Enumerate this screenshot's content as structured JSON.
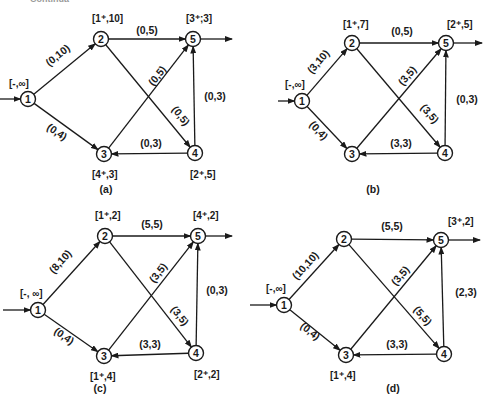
{
  "top_fragment": "Continua",
  "arrow_color": "#1a1a1a",
  "panels": [
    {
      "id": "a",
      "caption": "(a)",
      "caption_pos": [
        106,
        193
      ],
      "nodes": [
        {
          "id": 1,
          "x": 28,
          "y": 99,
          "label": "[-,∞]",
          "label_pos": [
            9,
            87
          ]
        },
        {
          "id": 2,
          "x": 101,
          "y": 39,
          "label": "[1⁺,10]",
          "label_pos": [
            92,
            22
          ]
        },
        {
          "id": 3,
          "x": 104,
          "y": 154,
          "label": "[4⁺,3]",
          "label_pos": [
            92,
            178
          ]
        },
        {
          "id": 4,
          "x": 195,
          "y": 153,
          "label": "[2⁺,5]",
          "label_pos": [
            190,
            178
          ]
        },
        {
          "id": 5,
          "x": 193,
          "y": 39,
          "label": "[3⁺;3]",
          "label_pos": [
            186,
            22
          ]
        }
      ],
      "source_arrow": {
        "from": [
          0,
          99
        ],
        "to": 1
      },
      "sink_arrow": {
        "from": 5,
        "to": [
          232,
          39
        ]
      },
      "edges": [
        {
          "from": 1,
          "to": 2,
          "label": "(0,10)",
          "label_pos": [
            60,
            58
          ],
          "angle": -39
        },
        {
          "from": 1,
          "to": 3,
          "label": "(0,4)",
          "label_pos": [
            55,
            135
          ],
          "angle": 34
        },
        {
          "from": 2,
          "to": 5,
          "label": "(0,5)",
          "label_pos": [
            147,
            34
          ],
          "angle": 0
        },
        {
          "from": 2,
          "to": 4,
          "label": "(0,5)",
          "label_pos": [
            178,
            118
          ],
          "angle": 52
        },
        {
          "from": 3,
          "to": 5,
          "label": "(0,5)",
          "label_pos": [
            160,
            78
          ],
          "angle": -51
        },
        {
          "from": 4,
          "to": 3,
          "label": "(0,3)",
          "label_pos": [
            151,
            147
          ],
          "angle": 0
        },
        {
          "from": 4,
          "to": 5,
          "label": "(0,3)",
          "label_pos": [
            215,
            100
          ],
          "angle": 0
        }
      ]
    },
    {
      "id": "b",
      "caption": "(b)",
      "caption_pos": [
        373,
        193
      ],
      "nodes": [
        {
          "id": 1,
          "x": 302,
          "y": 101,
          "label": "[-,∞]",
          "label_pos": [
            285,
            88
          ]
        },
        {
          "id": 2,
          "x": 352,
          "y": 43,
          "label": "[1⁺,7]",
          "label_pos": [
            343,
            28
          ]
        },
        {
          "id": 3,
          "x": 352,
          "y": 154,
          "label": "",
          "label_pos": [
            0,
            0
          ]
        },
        {
          "id": 4,
          "x": 445,
          "y": 153,
          "label": "",
          "label_pos": [
            0,
            0
          ]
        },
        {
          "id": 5,
          "x": 446,
          "y": 43,
          "label": "[2⁺,5]",
          "label_pos": [
            447,
            28
          ]
        }
      ],
      "source_arrow": {
        "from": [
          278,
          101
        ],
        "to": 1
      },
      "sink_arrow": {
        "from": 5,
        "to": [
          482,
          43
        ]
      },
      "edges": [
        {
          "from": 1,
          "to": 2,
          "label": "(3,10)",
          "label_pos": [
            321,
            64
          ],
          "angle": -49
        },
        {
          "from": 1,
          "to": 3,
          "label": "(0,4)",
          "label_pos": [
            316,
            133
          ],
          "angle": 47
        },
        {
          "from": 2,
          "to": 5,
          "label": "(0,5)",
          "label_pos": [
            402,
            35
          ],
          "angle": 0
        },
        {
          "from": 2,
          "to": 4,
          "label": "(3,5)",
          "label_pos": [
            427,
            116
          ],
          "angle": 50
        },
        {
          "from": 3,
          "to": 5,
          "label": "(3,5)",
          "label_pos": [
            410,
            78
          ],
          "angle": -50
        },
        {
          "from": 4,
          "to": 3,
          "label": "(3,3)",
          "label_pos": [
            401,
            147
          ],
          "angle": 0
        },
        {
          "from": 4,
          "to": 5,
          "label": "(0,3)",
          "label_pos": [
            467,
            103
          ],
          "angle": 0
        }
      ]
    },
    {
      "id": "c",
      "caption": "(c)",
      "caption_pos": [
        100,
        392
      ],
      "nodes": [
        {
          "id": 1,
          "x": 38,
          "y": 310,
          "label": "[-, ∞]",
          "label_pos": [
            20,
            297
          ]
        },
        {
          "id": 2,
          "x": 105,
          "y": 236,
          "label": "[1⁺,2]",
          "label_pos": [
            95,
            219
          ]
        },
        {
          "id": 3,
          "x": 104,
          "y": 356,
          "label": "[1⁺,4]",
          "label_pos": [
            90,
            380
          ]
        },
        {
          "id": 4,
          "x": 196,
          "y": 353,
          "label": "[2⁺,2]",
          "label_pos": [
            194,
            378
          ]
        },
        {
          "id": 5,
          "x": 198,
          "y": 236,
          "label": "[4⁺,2]",
          "label_pos": [
            193,
            219
          ]
        }
      ],
      "source_arrow": {
        "from": [
          3,
          310
        ],
        "to": 1
      },
      "sink_arrow": {
        "from": 5,
        "to": [
          232,
          236
        ]
      },
      "edges": [
        {
          "from": 1,
          "to": 2,
          "label": "(8,10)",
          "label_pos": [
            63,
            264
          ],
          "angle": -48
        },
        {
          "from": 1,
          "to": 3,
          "label": "(0,4)",
          "label_pos": [
            62,
            339
          ],
          "angle": 35
        },
        {
          "from": 2,
          "to": 5,
          "label": "(5,5)",
          "label_pos": [
            152,
            228
          ],
          "angle": 0
        },
        {
          "from": 2,
          "to": 4,
          "label": "(3,5)",
          "label_pos": [
            177,
            318
          ],
          "angle": 52
        },
        {
          "from": 3,
          "to": 5,
          "label": "(3,5)",
          "label_pos": [
            161,
            275
          ],
          "angle": -52
        },
        {
          "from": 4,
          "to": 3,
          "label": "(3,3)",
          "label_pos": [
            150,
            348
          ],
          "angle": 0
        },
        {
          "from": 4,
          "to": 5,
          "label": "(0,3)",
          "label_pos": [
            217,
            294
          ],
          "angle": 0
        }
      ]
    },
    {
      "id": "d",
      "caption": "(d)",
      "caption_pos": [
        393,
        392
      ],
      "nodes": [
        {
          "id": 1,
          "x": 284,
          "y": 305,
          "label": "[-,∞]",
          "label_pos": [
            266,
            292
          ]
        },
        {
          "id": 2,
          "x": 344,
          "y": 239,
          "label": "",
          "label_pos": [
            0,
            0
          ]
        },
        {
          "id": 3,
          "x": 346,
          "y": 355,
          "label": "[1⁺,4]",
          "label_pos": [
            330,
            379
          ]
        },
        {
          "id": 4,
          "x": 444,
          "y": 354,
          "label": "",
          "label_pos": [
            0,
            0
          ]
        },
        {
          "id": 5,
          "x": 441,
          "y": 240,
          "label": "[3⁺,2]",
          "label_pos": [
            448,
            225
          ]
        }
      ],
      "source_arrow": {
        "from": [
          250,
          305
        ],
        "to": 1
      },
      "sink_arrow": {
        "from": 5,
        "to": [
          480,
          240
        ]
      },
      "edges": [
        {
          "from": 1,
          "to": 2,
          "label": "(10,10)",
          "label_pos": [
            308,
            268
          ],
          "angle": -48
        },
        {
          "from": 1,
          "to": 3,
          "label": "(0,4)",
          "label_pos": [
            308,
            334
          ],
          "angle": 38
        },
        {
          "from": 2,
          "to": 5,
          "label": "(5,5)",
          "label_pos": [
            392,
            230
          ],
          "angle": 0
        },
        {
          "from": 2,
          "to": 4,
          "label": "(5,5)",
          "label_pos": [
            420,
            318
          ],
          "angle": 50
        },
        {
          "from": 3,
          "to": 5,
          "label": "(3,5)",
          "label_pos": [
            403,
            278
          ],
          "angle": -50
        },
        {
          "from": 4,
          "to": 3,
          "label": "(3,3)",
          "label_pos": [
            397,
            348
          ],
          "angle": 0
        },
        {
          "from": 4,
          "to": 5,
          "label": "(2,3)",
          "label_pos": [
            466,
            296
          ],
          "angle": 0
        }
      ]
    }
  ]
}
